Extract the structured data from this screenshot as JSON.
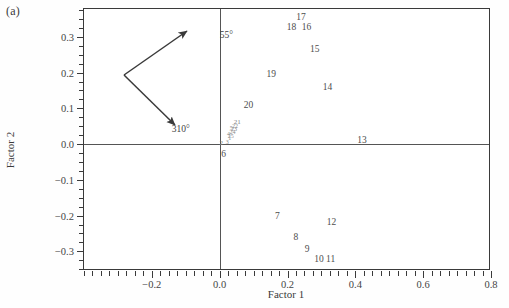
{
  "figure": {
    "panel_label": "(a)",
    "xlabel": "Factor 1",
    "ylabel": "Factor 2"
  },
  "annotations": [
    {
      "name": "angle-55",
      "label": "55°",
      "x": 0.02,
      "y": 0.305
    },
    {
      "name": "angle-310",
      "label": "310°",
      "x": -0.115,
      "y": 0.043
    }
  ],
  "chart_data": {
    "type": "scatter",
    "title": "",
    "xlabel": "Factor 1",
    "ylabel": "Factor 2",
    "xlim": [
      -0.4,
      0.8
    ],
    "ylim": [
      -0.355,
      0.378
    ],
    "xticks": [
      -0.2,
      0.0,
      0.2,
      0.4,
      0.6,
      0.8
    ],
    "xtick_labels": [
      "−0.2",
      "0.0",
      "0.2",
      "0.4",
      "0.6",
      "0.8"
    ],
    "yticks": [
      0.3,
      0.2,
      0.1,
      0.0,
      -0.1,
      -0.2,
      -0.3
    ],
    "ytick_labels": [
      "0.3",
      "0.2",
      "0.1",
      "0.0",
      "−0.1",
      "−0.2",
      "−0.3"
    ],
    "minor_tick_step": 0.025,
    "grid": false,
    "legend": false,
    "zero_lines": {
      "x": 0.0,
      "y": 0.0
    },
    "point_label_mode": "text-labels",
    "points": [
      {
        "label": "1",
        "x": 0.03,
        "y": 0.016,
        "size": "micro"
      },
      {
        "label": "2",
        "x": 0.005,
        "y": 0.003,
        "size": "tiny"
      },
      {
        "label": "3",
        "x": 0.022,
        "y": 0.007,
        "size": "micro"
      },
      {
        "label": "4",
        "x": 0.026,
        "y": 0.028,
        "size": "micro"
      },
      {
        "label": "5",
        "x": 0.034,
        "y": 0.046,
        "size": "micro"
      },
      {
        "label": "6",
        "x": 0.012,
        "y": -0.03,
        "size": "normal"
      },
      {
        "label": "7",
        "x": 0.17,
        "y": -0.205,
        "size": "normal"
      },
      {
        "label": "8",
        "x": 0.225,
        "y": -0.262,
        "size": "normal"
      },
      {
        "label": "9",
        "x": 0.258,
        "y": -0.295,
        "size": "normal"
      },
      {
        "label": "10",
        "x": 0.293,
        "y": -0.325,
        "size": "normal"
      },
      {
        "label": "11",
        "x": 0.327,
        "y": -0.325,
        "size": "normal"
      },
      {
        "label": "12",
        "x": 0.33,
        "y": -0.222,
        "size": "normal"
      },
      {
        "label": "13",
        "x": 0.42,
        "y": 0.008,
        "size": "normal"
      },
      {
        "label": "14",
        "x": 0.318,
        "y": 0.158,
        "size": "normal"
      },
      {
        "label": "15",
        "x": 0.28,
        "y": 0.262,
        "size": "normal"
      },
      {
        "label": "16",
        "x": 0.256,
        "y": 0.325,
        "size": "normal"
      },
      {
        "label": "17",
        "x": 0.24,
        "y": 0.352,
        "size": "normal"
      },
      {
        "label": "18",
        "x": 0.212,
        "y": 0.325,
        "size": "normal"
      },
      {
        "label": "19",
        "x": 0.152,
        "y": 0.192,
        "size": "normal"
      },
      {
        "label": "20",
        "x": 0.085,
        "y": 0.108,
        "size": "normal"
      },
      {
        "label": "21",
        "x": 0.052,
        "y": 0.062,
        "size": "tiny"
      },
      {
        "label": "22",
        "x": 0.045,
        "y": 0.052,
        "size": "micro"
      },
      {
        "label": "23",
        "x": 0.042,
        "y": 0.042,
        "size": "micro"
      },
      {
        "label": "24",
        "x": 0.038,
        "y": 0.033,
        "size": "micro"
      },
      {
        "label": "25",
        "x": 0.033,
        "y": 0.022,
        "size": "micro"
      }
    ]
  }
}
